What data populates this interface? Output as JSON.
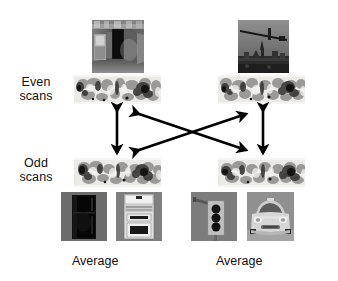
{
  "figure": {
    "background": "#ffffff",
    "width": 338,
    "height": 281,
    "type": "fmri-cross-validation-diagram"
  },
  "row_labels": [
    {
      "id": "even",
      "line1": "Even",
      "line2": "scans",
      "x": 8,
      "y": 76
    },
    {
      "id": "odd",
      "line1": "Odd",
      "line2": "scans",
      "x": 8,
      "y": 157
    }
  ],
  "captions": [
    {
      "id": "average-left",
      "text": "Average",
      "x": 72,
      "y": 254
    },
    {
      "id": "average-right",
      "text": "Average",
      "x": 216,
      "y": 254
    }
  ],
  "stimulus_images": [
    {
      "id": "indoor-kitchen-scene",
      "name": "indoor-scene-photo",
      "column": "left",
      "row": "even",
      "x": 92,
      "y": 20,
      "w": 52,
      "h": 53,
      "description": "grayscale indoor kitchen corridor with refrigerator and doorway",
      "base_color": "#5d5d5d"
    },
    {
      "id": "outdoor-cityscape-scene",
      "name": "outdoor-scene-photo",
      "column": "right",
      "row": "even",
      "x": 238,
      "y": 20,
      "w": 51,
      "h": 53,
      "description": "grayscale outdoor cityscape with crane and skyline",
      "base_color": "#6e6e6e"
    },
    {
      "id": "refrigerator-object",
      "name": "refrigerator-photo",
      "column": "left",
      "row": "average",
      "x": 61,
      "y": 192,
      "w": 46,
      "h": 49,
      "description": "dark refrigerator on gray background",
      "base_color": "#6b6b6b"
    },
    {
      "id": "stove-object",
      "name": "stove-photo",
      "column": "left",
      "row": "average",
      "x": 116,
      "y": 192,
      "w": 46,
      "h": 49,
      "description": "white kitchen stove with oven door and control panel",
      "base_color": "#8d8d8d"
    },
    {
      "id": "traffic-light-object",
      "name": "traffic-light-photo",
      "column": "right",
      "row": "average",
      "x": 191,
      "y": 192,
      "w": 46,
      "h": 49,
      "description": "traffic light with three dark lamps on gray background",
      "base_color": "#7a7a7a"
    },
    {
      "id": "car-object",
      "name": "car-photo",
      "column": "right",
      "row": "average",
      "x": 247,
      "y": 192,
      "w": 47,
      "h": 49,
      "description": "front view of a light colored car",
      "base_color": "#949494"
    }
  ],
  "brain_strips": [
    {
      "id": "even-left",
      "name": "brain-activation-strip",
      "column": "left",
      "row": "even",
      "x": 74,
      "y": 75,
      "w": 87,
      "h": 29
    },
    {
      "id": "even-right",
      "name": "brain-activation-strip",
      "column": "right",
      "row": "even",
      "x": 218,
      "y": 75,
      "w": 87,
      "h": 29
    },
    {
      "id": "odd-left",
      "name": "brain-activation-strip",
      "column": "left",
      "row": "odd",
      "x": 74,
      "y": 158,
      "w": 87,
      "h": 29
    },
    {
      "id": "odd-right",
      "name": "brain-activation-strip",
      "column": "right",
      "row": "odd",
      "x": 218,
      "y": 158,
      "w": 87,
      "h": 29
    }
  ],
  "arrows": [
    {
      "id": "within-left",
      "name": "within-category-arrow-left",
      "kind": "vertical",
      "x1": 117,
      "y1": 111,
      "x2": 117,
      "y2": 153,
      "double_headed": true
    },
    {
      "id": "within-right",
      "name": "within-category-arrow-right",
      "kind": "vertical",
      "x1": 263,
      "y1": 111,
      "x2": 263,
      "y2": 153,
      "double_headed": true
    },
    {
      "id": "cross-a",
      "name": "cross-category-arrow-a",
      "kind": "diagonal",
      "x1": 139,
      "y1": 114,
      "x2": 246,
      "y2": 150,
      "double_headed": true
    },
    {
      "id": "cross-b",
      "name": "cross-category-arrow-b",
      "kind": "diagonal",
      "x1": 139,
      "y1": 150,
      "x2": 246,
      "y2": 114,
      "double_headed": true
    }
  ],
  "colors": {
    "ink": "#000000",
    "text": "#111111",
    "background": "#ffffff",
    "strip_base": "#e8e8e6"
  }
}
